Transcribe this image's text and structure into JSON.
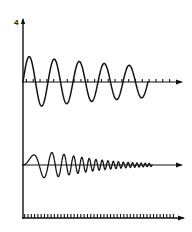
{
  "figure": {
    "title": "",
    "background_color": "#ffffff",
    "ink_color": "#111111",
    "width": 192,
    "height": 232
  },
  "labels": {
    "y_axis_top_label": "4"
  },
  "axes": {
    "vertical": {
      "name": "y-axis",
      "x": 23,
      "y_top": 20,
      "y_bottom": 218,
      "has_arrow_top": true
    },
    "upper_horizontal": {
      "name": "upper-time-axis",
      "y": 82,
      "x_start": 23,
      "x_end": 181,
      "has_arrow_right": true,
      "tick_count": 22,
      "tick_length": 3
    },
    "lower_horizontal": {
      "name": "lower-time-axis",
      "y": 165,
      "x_start": 23,
      "x_end": 181,
      "has_arrow_right": true,
      "tick_count": 0,
      "tick_length": 0
    },
    "bottom_horizontal": {
      "name": "bottom-scale-axis",
      "y": 218,
      "x_start": 23,
      "x_end": 183,
      "has_arrow_right": true,
      "tick_count": 46,
      "tick_length": 4
    }
  },
  "chart_data": {
    "type": "line",
    "title": "",
    "xlabel": "",
    "ylabel": "4",
    "grid": false,
    "legend": false,
    "xlim": [
      0,
      1
    ],
    "ylim": [
      -1,
      1
    ],
    "series": [
      {
        "name": "damped-oscillation-upper",
        "description": "Slowly damped sinusoid of roughly constant frequency, about 5 full cycles, amplitude decaying from peak to about 60 percent by the right end.",
        "model": "amplitude * exp(-decay * t) * sin(2*pi*freq*t + phase)",
        "cycles": 5,
        "amplitude_start": 26,
        "amplitude_end": 16,
        "decay_rate": 0.52,
        "frequency_cycles_per_span": 5.0,
        "x_start": 23,
        "x_end": 148,
        "baseline_y": 82,
        "peaks_y": [
          56,
          62,
          64,
          65,
          66
        ],
        "troughs_y": [
          104,
          101,
          100,
          99,
          98
        ]
      },
      {
        "name": "chirp-oscillation-lower",
        "description": "Frequency-swept chirp with exponentially decaying envelope; frequency increases from about 2 cycles per unit at the left to over 30 at the right while the envelope collapses toward the axis.",
        "model": "amplitude * exp(-decay * t) * sin(2*pi*(f0 + (f1-f0)*t/2)*t)",
        "cycles_visible": 30,
        "amplitude_start": 14,
        "amplitude_peak": 27,
        "amplitude_end": 2,
        "decay_rate": 3.1,
        "frequency_start": 2.0,
        "frequency_end": 34.0,
        "x_start": 23,
        "x_end": 152,
        "baseline_y": 165,
        "envelope_peak_x": 66,
        "envelope_peak_y": 138
      }
    ]
  }
}
